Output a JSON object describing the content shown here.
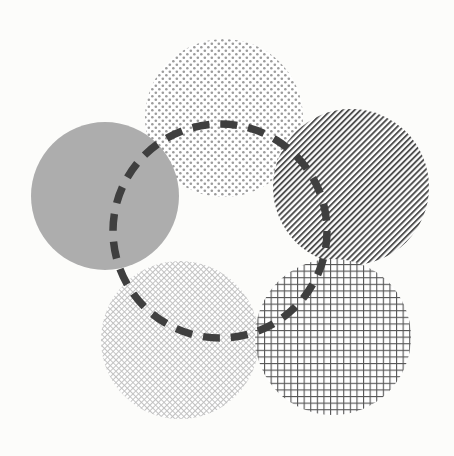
{
  "figure": {
    "canvas": {
      "width": 454,
      "height": 456,
      "background": "#fcfcfa"
    },
    "shapes": [
      {
        "id": "circle-dotted-top",
        "name": "top-dotted-circle",
        "pattern": "dots",
        "pattern_label": "Dotted",
        "color": "#9b9b9b",
        "cx": 224,
        "cy": 118,
        "r": 79,
        "pattern_spacing": 7,
        "pattern_size": 2.6,
        "opacity": 1
      },
      {
        "id": "circle-solid-left",
        "name": "left-solid-gray-circle",
        "pattern": "solid",
        "pattern_label": "Solid gray",
        "color": "#adadad",
        "cx": 105,
        "cy": 196,
        "r": 74,
        "pattern_spacing": 0,
        "pattern_size": 0,
        "opacity": 1
      },
      {
        "id": "circle-diagonal-right",
        "name": "right-diagonal-stripe-circle",
        "pattern": "diagonal-stripes",
        "pattern_label": "Diagonal stripes",
        "color": "#555555",
        "cx": 351,
        "cy": 187,
        "r": 78,
        "pattern_spacing": 4.2,
        "pattern_size": 1.8,
        "opacity": 1
      },
      {
        "id": "circle-crosshatch-bottomleft",
        "name": "bottom-left-fine-crosshatch-circle",
        "pattern": "fine-diagonal-crosshatch",
        "pattern_label": "Fine diamond crosshatch",
        "color": "#c9c9c9",
        "cx": 180,
        "cy": 340,
        "r": 79,
        "pattern_spacing": 4.0,
        "pattern_size": 0.9,
        "opacity": 1
      },
      {
        "id": "circle-grid-bottomright",
        "name": "bottom-right-grid-circle",
        "pattern": "square-grid",
        "pattern_label": "Square grid",
        "color": "#565656",
        "cx": 333,
        "cy": 337,
        "r": 78,
        "pattern_spacing": 6.6,
        "pattern_size": 1.1,
        "opacity": 1
      }
    ],
    "overlay": {
      "id": "dashed-circle-outline",
      "name": "dashed-circle-overlay",
      "pattern": "dashed-outline",
      "pattern_label": "Dashed outline",
      "color": "#3f3f3f",
      "cx": 220,
      "cy": 231,
      "r": 107,
      "stroke_width": 7.5,
      "dash": "17 11"
    }
  }
}
